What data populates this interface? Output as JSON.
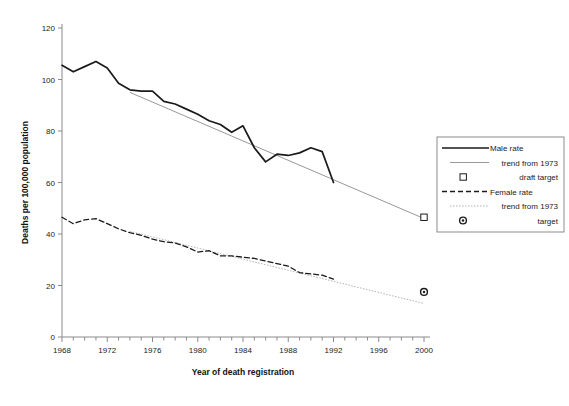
{
  "chart_data": {
    "type": "line",
    "title": "",
    "xlabel": "Year of death registration",
    "ylabel": "Deaths per 100,000 population",
    "xlim": [
      1968,
      2000
    ],
    "ylim": [
      0,
      120
    ],
    "ytick_step": 20,
    "xtick_step": 1,
    "xtick_label_step": 4,
    "grid": false,
    "legend_position": "right",
    "yticks": [
      "0",
      "20",
      "40",
      "60",
      "80",
      "100",
      "120"
    ],
    "xticks": [
      "1968",
      "1972",
      "1976",
      "1980",
      "1984",
      "1988",
      "1992",
      "1996",
      "2000"
    ],
    "x": [
      1968,
      1969,
      1970,
      1971,
      1972,
      1973,
      1974,
      1975,
      1976,
      1977,
      1978,
      1979,
      1980,
      1981,
      1982,
      1983,
      1984,
      1985,
      1986,
      1987,
      1988,
      1989,
      1990,
      1991,
      1992
    ],
    "series": [
      {
        "name": "Male rate",
        "style": "solid",
        "color": "#1a1a1a",
        "values": [
          105.5,
          103.0,
          105.0,
          107.0,
          104.5,
          98.5,
          96.0,
          95.5,
          95.5,
          91.5,
          90.5,
          88.5,
          86.5,
          84.0,
          82.5,
          79.5,
          82.0,
          73.5,
          68.0,
          71.0,
          70.5,
          71.5,
          73.5,
          72.0,
          60.0
        ]
      },
      {
        "name": "Female rate",
        "style": "dashed",
        "color": "#1a1a1a",
        "values": [
          46.5,
          44.0,
          45.5,
          46.0,
          44.0,
          42.0,
          40.5,
          39.5,
          38.0,
          37.0,
          36.5,
          35.0,
          33.0,
          33.5,
          31.5,
          31.5,
          31.0,
          30.5,
          29.5,
          28.5,
          27.5,
          25.0,
          24.5,
          24.0,
          22.5
        ]
      }
    ],
    "trends": [
      {
        "name": "trend from 1973 (male)",
        "style": "thin-solid",
        "color": "#999999",
        "x_start": 1974,
        "y_start": 95.0,
        "x_end": 2000,
        "y_end": 46.0
      },
      {
        "name": "trend from 1973 (female)",
        "style": "dotted",
        "color": "#aaaaaa",
        "x_start": 1974,
        "y_start": 41.0,
        "x_end": 2000,
        "y_end": 13.0
      }
    ],
    "markers": [
      {
        "name": "draft target",
        "shape": "open-square",
        "x": 2000,
        "y": 46.5
      },
      {
        "name": "target",
        "shape": "filled-circle-dot",
        "x": 2000,
        "y": 17.5
      }
    ]
  },
  "legend": {
    "items": [
      {
        "label": "Male rate",
        "symbol": "solid-line"
      },
      {
        "label": "trend from 1973",
        "symbol": "thin-line"
      },
      {
        "label": "draft target",
        "symbol": "open-square"
      },
      {
        "label": "Female rate",
        "symbol": "dashed-line"
      },
      {
        "label": "trend from 1973",
        "symbol": "dotted-line"
      },
      {
        "label": "target",
        "symbol": "dot-marker"
      }
    ]
  },
  "colors": {
    "data_line": "#1a1a1a",
    "trend_male": "#999999",
    "trend_female": "#aaaaaa",
    "axis": "#8a8a8a",
    "text": "#222222",
    "legend_border": "#808080",
    "background": "#ffffff"
  }
}
